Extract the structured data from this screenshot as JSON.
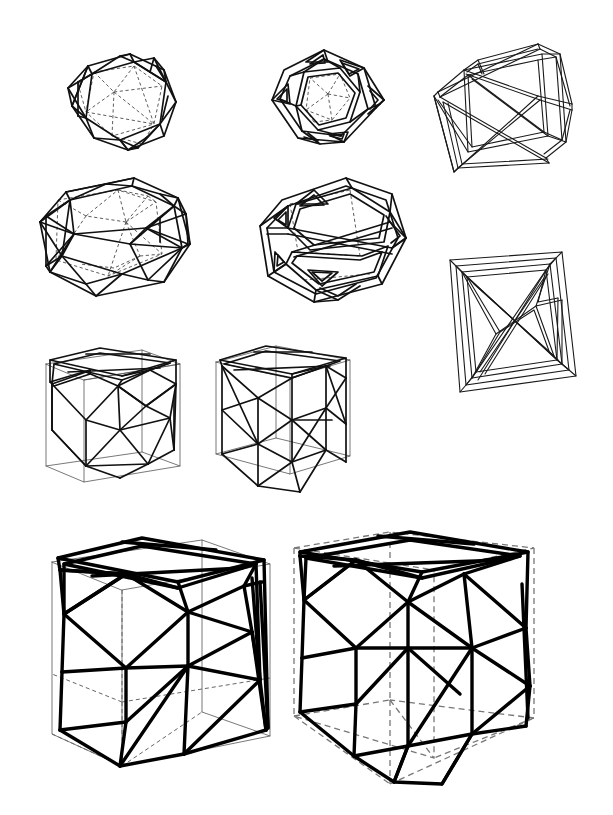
{
  "plate": {
    "title": "Polyhedral strut-frame study plate",
    "description": "Eight line-drawn three-dimensional wireframe polyhedra arranged in four rows on a plain white page",
    "width": 613,
    "height": 815,
    "background_color": "#ffffff",
    "ink_color": "#000000",
    "hidden_line_color": "#4a4a4a",
    "guide_line_color": "#777777",
    "figure_count": 8,
    "caption": ""
  },
  "figures": [
    {
      "id": "fig-1",
      "name": "icosahedron-single-line-dashed",
      "row": 1,
      "column": 1,
      "label": "",
      "shape": "icosahedral frame, single-line edges with dashed hidden edges",
      "render_style": "single-line",
      "hidden_lines": "dashed",
      "x": 46,
      "y": 30,
      "width": 150,
      "height": 130
    },
    {
      "id": "fig-2",
      "name": "icosahedron-double-line-struts",
      "row": 1,
      "column": 2,
      "label": "",
      "shape": "icosahedral frame drawn as flat ribbon struts",
      "render_style": "double-line strut",
      "hidden_lines": "dotted",
      "x": 248,
      "y": 30,
      "width": 145,
      "height": 125
    },
    {
      "id": "fig-3",
      "name": "octahedron-double-line-struts-upper",
      "row": 1,
      "column": 3,
      "label": "",
      "shape": "octahedral / tetrahedral strut frame seen from above left",
      "render_style": "double-line strut",
      "hidden_lines": "none",
      "x": 424,
      "y": 36,
      "width": 165,
      "height": 140
    },
    {
      "id": "fig-4",
      "name": "elongated-polyhedron-single-line-dashed",
      "row": 2,
      "column": 1,
      "label": "",
      "shape": "elongated icosahedral frame, single-line edges with dashed hidden edges",
      "render_style": "single-line",
      "hidden_lines": "dashed",
      "x": 26,
      "y": 160,
      "width": 175,
      "height": 145
    },
    {
      "id": "fig-5",
      "name": "elongated-polyhedron-double-line-struts",
      "row": 2,
      "column": 2,
      "label": "",
      "shape": "elongated icosahedral frame drawn as flat ribbon struts",
      "render_style": "double-line strut",
      "hidden_lines": "dotted",
      "x": 246,
      "y": 166,
      "width": 165,
      "height": 145
    },
    {
      "id": "fig-6",
      "name": "octahedron-double-line-struts-lower",
      "row": 2,
      "column": 3,
      "label": "",
      "shape": "octahedral / tetrahedral strut frame seen from the front",
      "render_style": "double-line strut",
      "hidden_lines": "none",
      "x": 442,
      "y": 250,
      "width": 140,
      "height": 145
    },
    {
      "id": "fig-7",
      "name": "cube-inscribed-struts-small-left",
      "row": 3,
      "column": 1,
      "label": "",
      "shape": "cube with inscribed woven diagonal struts",
      "render_style": "bold struts over thin cube guide",
      "hidden_lines": "thin solid guide cube",
      "x": 36,
      "y": 340,
      "width": 148,
      "height": 150
    },
    {
      "id": "fig-8",
      "name": "cube-inscribed-struts-small-right",
      "row": 3,
      "column": 2,
      "label": "",
      "shape": "cube with inscribed woven diagonal struts, rotated view",
      "render_style": "bold struts over thin cube guide",
      "hidden_lines": "thin solid guide cube",
      "x": 205,
      "y": 340,
      "width": 150,
      "height": 155
    },
    {
      "id": "fig-9",
      "name": "cube-inscribed-struts-large-left",
      "row": 4,
      "column": 1,
      "label": "",
      "shape": "large cube with heavy inscribed woven diagonal struts",
      "render_style": "heavy struts over thin cube with dashed hidden edges",
      "hidden_lines": "dashed",
      "x": 40,
      "y": 528,
      "width": 235,
      "height": 250
    },
    {
      "id": "fig-10",
      "name": "cube-inscribed-struts-large-right",
      "row": 4,
      "column": 2,
      "label": "",
      "shape": "large tilted cube with heavy inscribed woven diagonal struts",
      "render_style": "heavy struts over fully dashed cube outline",
      "hidden_lines": "dashed throughout",
      "x": 288,
      "y": 525,
      "width": 250,
      "height": 265
    }
  ],
  "legend": {
    "solid_line": "visible edge",
    "dashed_line": "hidden edge",
    "double_line": "strut drawn as a solid bar",
    "thin_grey_line": "construction / bounding cube"
  }
}
